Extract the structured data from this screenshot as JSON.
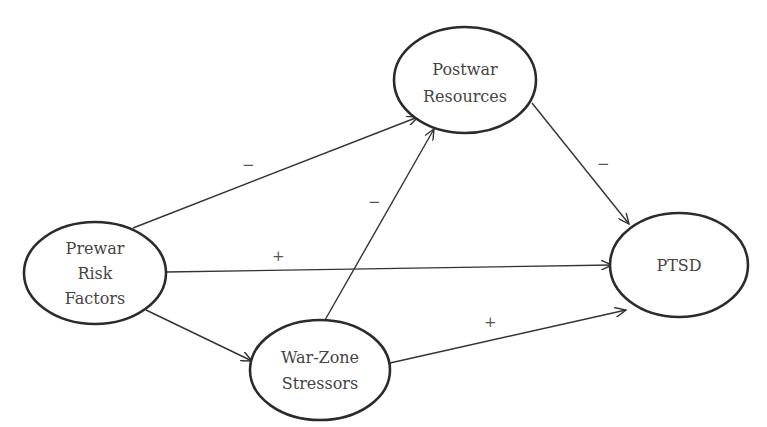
{
  "diagram": {
    "type": "path-model",
    "nodes": [
      {
        "id": "prewar",
        "lines": [
          "Prewar",
          "Risk",
          "Factors"
        ],
        "cx": 95,
        "cy": 273,
        "rx": 71,
        "ry": 51
      },
      {
        "id": "postwar",
        "lines": [
          "Postwar",
          "Resources"
        ],
        "cx": 465,
        "cy": 80,
        "rx": 71,
        "ry": 53
      },
      {
        "id": "warzone",
        "lines": [
          "War-Zone",
          "Stressors"
        ],
        "cx": 320,
        "cy": 370,
        "rx": 70,
        "ry": 50
      },
      {
        "id": "ptsd",
        "lines": [
          "PTSD"
        ],
        "cx": 679,
        "cy": 265,
        "rx": 69,
        "ry": 52
      }
    ],
    "edges": [
      {
        "from": "prewar",
        "to": "postwar",
        "sign": "−"
      },
      {
        "from": "prewar",
        "to": "ptsd",
        "sign": "+"
      },
      {
        "from": "prewar",
        "to": "warzone",
        "sign": ""
      },
      {
        "from": "warzone",
        "to": "postwar",
        "sign": "−"
      },
      {
        "from": "warzone",
        "to": "ptsd",
        "sign": "+"
      },
      {
        "from": "postwar",
        "to": "ptsd",
        "sign": "−"
      }
    ]
  },
  "labels": {
    "prewar": {
      "l1": "Prewar",
      "l2": "Risk",
      "l3": "Factors"
    },
    "postwar": {
      "l1": "Postwar",
      "l2": "Resources"
    },
    "warzone": {
      "l1": "War-Zone",
      "l2": "Stressors"
    },
    "ptsd": {
      "l1": "PTSD"
    },
    "signs": {
      "prewar_postwar": "−",
      "prewar_ptsd": "+",
      "warzone_postwar": "−",
      "warzone_ptsd": "+",
      "postwar_ptsd": "−"
    }
  },
  "colors": {
    "stroke": "#2b2b2b",
    "text": "#444444",
    "background": "#ffffff"
  }
}
